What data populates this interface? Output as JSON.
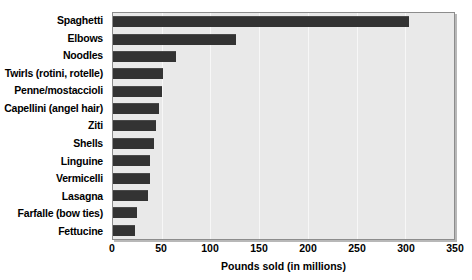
{
  "chart_data": {
    "type": "bar",
    "orientation": "horizontal",
    "title": "",
    "xlabel": "Pounds sold (in millions)",
    "ylabel": "",
    "xlim": [
      0,
      350
    ],
    "xticks": [
      0,
      50,
      100,
      150,
      200,
      250,
      300,
      350
    ],
    "grid": true,
    "legend": null,
    "categories": [
      "Spaghetti",
      "Elbows",
      "Noodles",
      "Twirls (rotini, rotelle)",
      "Penne/mostaccioli",
      "Capellini (angel hair)",
      "Ziti",
      "Shells",
      "Linguine",
      "Vermicelli",
      "Lasagna",
      "Farfalle (bow ties)",
      "Fettucine"
    ],
    "values": [
      302,
      126,
      64,
      51,
      50,
      47,
      44,
      42,
      38,
      38,
      36,
      24,
      22
    ],
    "bar_color": "#333333",
    "plot_background": "#e9e9e9",
    "gridline_color": "#f7f7f7"
  }
}
